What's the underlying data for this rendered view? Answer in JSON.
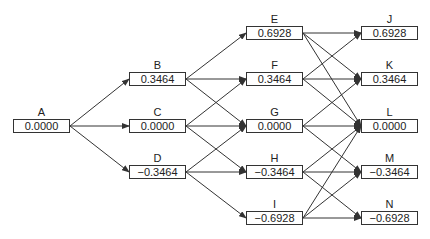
{
  "diagram": {
    "type": "trinomial-tree",
    "nodes": [
      {
        "id": "A",
        "value": "0.0000",
        "x": 13,
        "y": 119
      },
      {
        "id": "B",
        "value": "0.3464",
        "x": 129,
        "y": 72
      },
      {
        "id": "C",
        "value": "0.0000",
        "x": 129,
        "y": 119
      },
      {
        "id": "D",
        "value": "−0.3464",
        "x": 129,
        "y": 165
      },
      {
        "id": "E",
        "value": "0.6928",
        "x": 246,
        "y": 26
      },
      {
        "id": "F",
        "value": "0.3464",
        "x": 246,
        "y": 72
      },
      {
        "id": "G",
        "value": "0.0000",
        "x": 246,
        "y": 119
      },
      {
        "id": "H",
        "value": "−0.3464",
        "x": 246,
        "y": 165
      },
      {
        "id": "I",
        "value": "−0.6928",
        "x": 246,
        "y": 211
      },
      {
        "id": "J",
        "value": "0.6928",
        "x": 361,
        "y": 26
      },
      {
        "id": "K",
        "value": "0.3464",
        "x": 361,
        "y": 72
      },
      {
        "id": "L",
        "value": "0.0000",
        "x": 361,
        "y": 119
      },
      {
        "id": "M",
        "value": "−0.3464",
        "x": 361,
        "y": 165
      },
      {
        "id": "N",
        "value": "−0.6928",
        "x": 361,
        "y": 211
      }
    ],
    "edges": [
      [
        "A",
        "B"
      ],
      [
        "A",
        "C"
      ],
      [
        "A",
        "D"
      ],
      [
        "B",
        "E"
      ],
      [
        "B",
        "F"
      ],
      [
        "B",
        "G"
      ],
      [
        "C",
        "F"
      ],
      [
        "C",
        "G"
      ],
      [
        "C",
        "H"
      ],
      [
        "D",
        "G"
      ],
      [
        "D",
        "H"
      ],
      [
        "D",
        "I"
      ],
      [
        "E",
        "J"
      ],
      [
        "E",
        "K"
      ],
      [
        "E",
        "L"
      ],
      [
        "F",
        "J"
      ],
      [
        "F",
        "K"
      ],
      [
        "F",
        "L"
      ],
      [
        "G",
        "K"
      ],
      [
        "G",
        "L"
      ],
      [
        "G",
        "M"
      ],
      [
        "H",
        "L"
      ],
      [
        "H",
        "M"
      ],
      [
        "H",
        "N"
      ],
      [
        "I",
        "L"
      ],
      [
        "I",
        "M"
      ],
      [
        "I",
        "N"
      ]
    ]
  }
}
